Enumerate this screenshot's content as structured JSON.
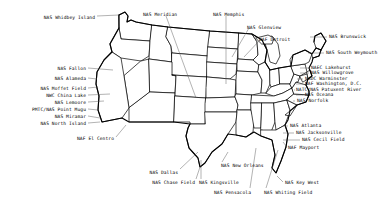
{
  "figure": {
    "background_color": "#ffffff",
    "ink_color": "#000000",
    "leader_color": "#555555",
    "width": 391,
    "height": 208
  },
  "labels": [
    {
      "id": "nas-whidbey-island",
      "text": "NAS Whidbey Island",
      "x": 95,
      "y": 15,
      "align": "right",
      "leader": [
        [
          97,
          16
        ],
        [
          119,
          15
        ]
      ]
    },
    {
      "id": "nas-meridian",
      "text": "NAS Meridian",
      "x": 143,
      "y": 12,
      "align": "left",
      "leader": [
        [
          166,
          16
        ],
        [
          196,
          98
        ]
      ]
    },
    {
      "id": "nas-memphis",
      "text": "NAS Memphis",
      "x": 213,
      "y": 12,
      "align": "left",
      "leader": [
        [
          226,
          16
        ],
        [
          226,
          84
        ]
      ]
    },
    {
      "id": "nas-glenview",
      "text": "NAS Glenview",
      "x": 247,
      "y": 25,
      "align": "left",
      "leader": [
        [
          249,
          28
        ],
        [
          232,
          57
        ]
      ]
    },
    {
      "id": "naf-detroit",
      "text": "NAF Detroit",
      "x": 259,
      "y": 37,
      "align": "left",
      "leader": [
        [
          260,
          40
        ],
        [
          244,
          57
        ]
      ]
    },
    {
      "id": "nas-brunswick",
      "text": "NAS Brunswick",
      "x": 329,
      "y": 34,
      "align": "left",
      "leader": [
        [
          310,
          37
        ],
        [
          327,
          37
        ]
      ]
    },
    {
      "id": "nas-south-weymouth",
      "text": "NAS South Weymouth",
      "x": 326,
      "y": 50,
      "align": "left",
      "leader": [
        [
          308,
          53
        ],
        [
          324,
          53
        ]
      ]
    },
    {
      "id": "naec-lakehurst",
      "text": "NAEC Lakehurst",
      "x": 311,
      "y": 65,
      "align": "left",
      "leader": [
        [
          300,
          68
        ],
        [
          309,
          68
        ]
      ]
    },
    {
      "id": "nas-willowgrove",
      "text": "NAS Willowgrove",
      "x": 311,
      "y": 70,
      "align": "left",
      "leader": [
        [
          300,
          73
        ],
        [
          309,
          73
        ]
      ]
    },
    {
      "id": "nadc-warminster",
      "text": "NADC Warminster",
      "x": 305,
      "y": 76,
      "align": "left",
      "leader": [
        [
          297,
          79
        ],
        [
          303,
          79
        ]
      ]
    },
    {
      "id": "naf-washington-dc",
      "text": "NAF Washington, D.C.",
      "x": 305,
      "y": 81,
      "align": "left",
      "leader": [
        [
          296,
          84
        ],
        [
          303,
          84
        ]
      ]
    },
    {
      "id": "natc-nas-patuxent-river",
      "text": "NATC/NAS Patuxent River",
      "x": 296,
      "y": 87,
      "align": "left",
      "leader": [
        [
          294,
          90
        ],
        [
          295,
          90
        ]
      ]
    },
    {
      "id": "nas-oceana",
      "text": "NAS Oceana",
      "x": 305,
      "y": 92,
      "align": "left",
      "leader": [
        [
          296,
          95
        ],
        [
          303,
          95
        ]
      ]
    },
    {
      "id": "nas-norfolk",
      "text": "NAS Norfolk",
      "x": 297,
      "y": 98,
      "align": "left",
      "leader": [
        [
          293,
          101
        ],
        [
          295,
          101
        ]
      ]
    },
    {
      "id": "nas-fallon",
      "text": "NAS Fallon",
      "x": 86,
      "y": 66,
      "align": "right",
      "leader": [
        [
          88,
          68
        ],
        [
          113,
          70
        ]
      ]
    },
    {
      "id": "nas-alameda",
      "text": "NAS Alameda",
      "x": 86,
      "y": 76,
      "align": "right",
      "leader": [
        [
          88,
          78
        ],
        [
          97,
          79
        ]
      ]
    },
    {
      "id": "nas-moffet-field",
      "text": "NAS Moffet Field",
      "x": 86,
      "y": 86,
      "align": "right",
      "leader": [
        [
          88,
          88
        ],
        [
          98,
          87
        ]
      ]
    },
    {
      "id": "nwc-china-lake",
      "text": "NWC China Lake",
      "x": 86,
      "y": 93,
      "align": "right",
      "leader": [
        [
          88,
          95
        ],
        [
          110,
          94
        ]
      ]
    },
    {
      "id": "nas-lemoore",
      "text": "NAS Lemoore",
      "x": 86,
      "y": 100,
      "align": "right",
      "leader": [
        [
          88,
          102
        ],
        [
          104,
          101
        ]
      ]
    },
    {
      "id": "pmtc-nas-point-mugu",
      "text": "PMTC/NAS Point Mugu",
      "x": 86,
      "y": 107,
      "align": "right",
      "leader": [
        [
          88,
          109
        ],
        [
          98,
          110
        ]
      ]
    },
    {
      "id": "nas-miramar",
      "text": "NAS Miramar",
      "x": 86,
      "y": 114,
      "align": "right",
      "leader": [
        [
          88,
          116
        ],
        [
          100,
          118
        ]
      ]
    },
    {
      "id": "nas-north-island",
      "text": "NAS North Island",
      "x": 86,
      "y": 121,
      "align": "right",
      "leader": [
        [
          88,
          123
        ],
        [
          100,
          122
        ]
      ]
    },
    {
      "id": "naf-el-centro",
      "text": "NAF El Centro",
      "x": 114,
      "y": 136,
      "align": "right",
      "leader": [
        [
          116,
          137
        ],
        [
          126,
          125
        ]
      ]
    },
    {
      "id": "nas-atlanta",
      "text": "NAS Atlanta",
      "x": 290,
      "y": 123,
      "align": "left",
      "leader": [
        [
          283,
          126
        ],
        [
          288,
          126
        ]
      ]
    },
    {
      "id": "nas-jacksonville",
      "text": "NAS Jacksonville",
      "x": 296,
      "y": 130,
      "align": "left",
      "leader": [
        [
          283,
          133
        ],
        [
          294,
          133
        ]
      ]
    },
    {
      "id": "nas-cecil-field",
      "text": "NAS Cecil Field",
      "x": 302,
      "y": 137,
      "align": "left",
      "leader": [
        [
          283,
          140
        ],
        [
          300,
          140
        ]
      ]
    },
    {
      "id": "naf-mayport",
      "text": "NAF Mayport",
      "x": 288,
      "y": 145,
      "align": "left",
      "leader": [
        [
          283,
          142
        ],
        [
          287,
          147
        ]
      ]
    },
    {
      "id": "nas-dallas",
      "text": "NAS Dallas",
      "x": 178,
      "y": 170,
      "align": "right",
      "leader": [
        [
          180,
          169
        ],
        [
          198,
          152
        ]
      ]
    },
    {
      "id": "nas-chase-field",
      "text": "NAS Chase Field",
      "x": 195,
      "y": 180,
      "align": "right",
      "leader": [
        [
          196,
          179
        ],
        [
          200,
          167
        ]
      ]
    },
    {
      "id": "nas-kingsville",
      "text": "NAS Kingsville",
      "x": 199,
      "y": 180,
      "align": "left",
      "leader": [
        [
          201,
          179
        ],
        [
          201,
          160
        ]
      ]
    },
    {
      "id": "nas-new-orleans",
      "text": "NAS New Orleans",
      "x": 221,
      "y": 163,
      "align": "left",
      "leader": [
        [
          222,
          162
        ],
        [
          228,
          152
        ]
      ]
    },
    {
      "id": "nas-pensacola",
      "text": "NAS Pensacola",
      "x": 214,
      "y": 190,
      "align": "left",
      "leader": [
        [
          250,
          188
        ],
        [
          256,
          148
        ]
      ]
    },
    {
      "id": "nas-whiting-field",
      "text": "NAS Whiting Field",
      "x": 264,
      "y": 190,
      "align": "left",
      "leader": [
        [
          266,
          188
        ],
        [
          278,
          150
        ]
      ]
    },
    {
      "id": "nas-key-west",
      "text": "NAS Key West",
      "x": 285,
      "y": 180,
      "align": "left",
      "leader": [
        [
          283,
          182
        ],
        [
          277,
          176
        ]
      ]
    }
  ]
}
